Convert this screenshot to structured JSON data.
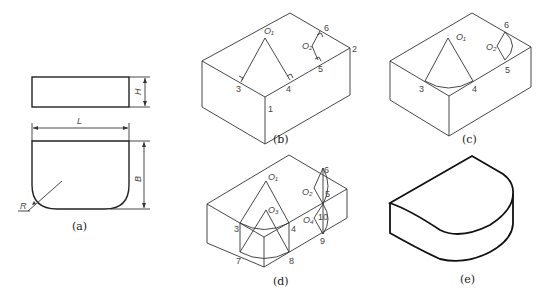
{
  "figure": {
    "panels": [
      {
        "id": "a",
        "caption": "(a)",
        "description": "Orthographic views with dimensions",
        "dims": {
          "height": "H",
          "length": "L",
          "breadth": "B",
          "radius": "R"
        }
      },
      {
        "id": "b",
        "caption": "(b)",
        "points": {
          "o1": "O₁",
          "o2": "O₂",
          "p1": "1",
          "p2": "2",
          "p3": "3",
          "p4": "4",
          "p5": "5",
          "p6": "6"
        }
      },
      {
        "id": "c",
        "caption": "(c)",
        "points": {
          "o1": "O₁",
          "o2": "O₂",
          "p3": "3",
          "p4": "4",
          "p5": "5",
          "p6": "6"
        }
      },
      {
        "id": "d",
        "caption": "(d)",
        "points": {
          "o1": "O₁",
          "o2": "O₂",
          "o3": "O₃",
          "o4": "O₄",
          "p3": "3",
          "p4": "4",
          "p5": "5",
          "p6": "6",
          "p7": "7",
          "p8": "8",
          "p9": "9",
          "p10": "10"
        }
      },
      {
        "id": "e",
        "caption": "(e)",
        "description": "Finished isometric view"
      }
    ]
  }
}
